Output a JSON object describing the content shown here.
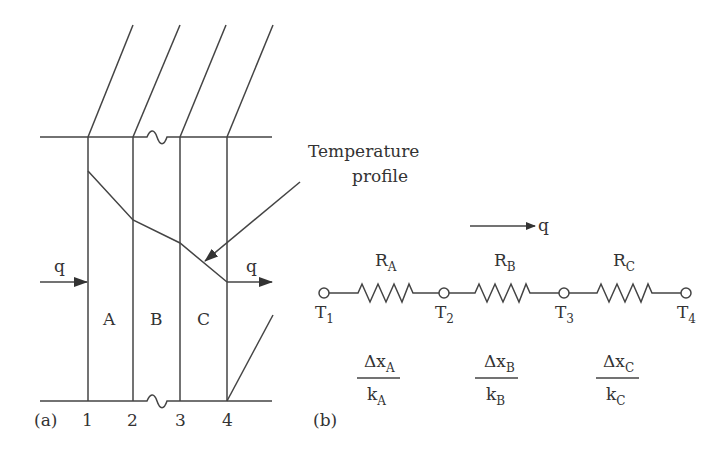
{
  "figure_a": {
    "panel_label": "(a)",
    "layers": [
      "A",
      "B",
      "C"
    ],
    "interfaces": [
      "1",
      "2",
      "3",
      "4"
    ],
    "heat_flow_in": "q",
    "heat_flow_out": "q",
    "annotation": {
      "line1": "Temperature",
      "line2": "profile"
    }
  },
  "figure_b": {
    "panel_label": "(b)",
    "heat_flow": "q",
    "resistors": [
      {
        "name": "R",
        "sub": "A",
        "num": "Δx",
        "num_sub": "A",
        "den": "k",
        "den_sub": "A"
      },
      {
        "name": "R",
        "sub": "B",
        "num": "Δx",
        "num_sub": "B",
        "den": "k",
        "den_sub": "B"
      },
      {
        "name": "R",
        "sub": "C",
        "num": "Δx",
        "num_sub": "C",
        "den": "k",
        "den_sub": "C"
      }
    ],
    "nodes": [
      {
        "name": "T",
        "sub": "1"
      },
      {
        "name": "T",
        "sub": "2"
      },
      {
        "name": "T",
        "sub": "3"
      },
      {
        "name": "T",
        "sub": "4"
      }
    ]
  }
}
